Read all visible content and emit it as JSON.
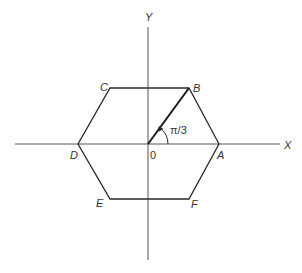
{
  "diagram": {
    "axes": {
      "x_label": "X",
      "y_label": "Y",
      "origin_label": "0"
    },
    "vertices": {
      "A": "A",
      "B": "B",
      "C": "C",
      "D": "D",
      "E": "E",
      "F": "F"
    },
    "angle_label": "π/3",
    "colors": {
      "background": "#ffffff",
      "lines": "#2a2a2a",
      "axes": "#555555",
      "text": "#333333"
    }
  }
}
